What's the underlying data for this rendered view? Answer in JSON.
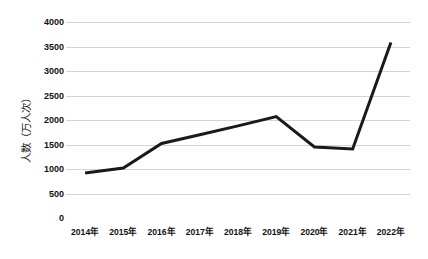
{
  "chart_data": {
    "type": "line",
    "title": "",
    "subtitle": "",
    "xlabel": "",
    "ylabel": "人数（万人次）",
    "categories": [
      "2014年",
      "2015年",
      "2016年",
      "2017年",
      "2018年",
      "2019年",
      "2020年",
      "2021年",
      "2022年"
    ],
    "series": [
      {
        "name": "人数（万人次）",
        "values": [
          920,
          1020,
          1520,
          1700,
          1880,
          2070,
          1450,
          1410,
          3580
        ]
      }
    ],
    "ylim": [
      0,
      4000
    ],
    "ytick_values": [
      0,
      500,
      1000,
      1500,
      2000,
      2500,
      3000,
      3500,
      4000
    ],
    "ytick_labels": [
      "0",
      "500",
      "1000",
      "1500",
      "2000",
      "2500",
      "3000",
      "3500",
      "4000"
    ],
    "grid": "horizontal",
    "legend": "none",
    "line_color": "#1a1a1a",
    "line_width": 3,
    "grid_color": "#d4d4d4",
    "background_color": "#ffffff",
    "markers": false
  },
  "caption": {
    "text": ""
  }
}
